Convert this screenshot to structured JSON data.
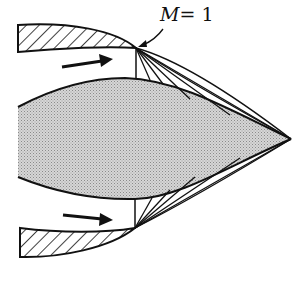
{
  "figure": {
    "label_M": "M",
    "label_eq": "= 1",
    "colors": {
      "line": "#111111",
      "fill": "#c8c8c8",
      "background": "#ffffff"
    }
  }
}
